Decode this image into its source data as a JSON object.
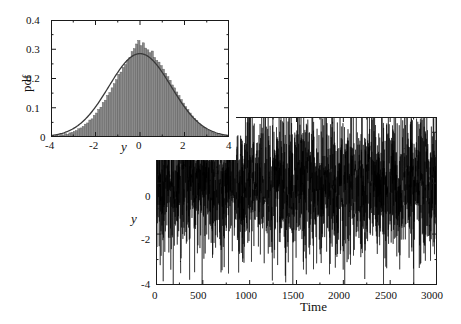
{
  "figure": {
    "background_color": "#ffffff",
    "axis_color": "#1a1a1a",
    "trace_color": "#000000",
    "hist_fill_color": "#8a8a8a",
    "hist_edge_color": "#555555",
    "curve_color": "#3a3a3a"
  },
  "chart_data": [
    {
      "type": "line",
      "name": "time-series",
      "title": "",
      "xlabel": "Time",
      "ylabel": "y",
      "xlim": [
        0,
        3000
      ],
      "ylim": [
        -4,
        2.6
      ],
      "grid": false,
      "legend": "none",
      "xticks": [
        0,
        500,
        1000,
        1500,
        2000,
        2500,
        3000
      ],
      "xtick_labels": [
        "0",
        "500",
        "1000",
        "1500",
        "2000",
        "2500",
        "3000"
      ],
      "yticks": [
        2,
        0,
        -2,
        -4
      ],
      "ytick_labels": [
        "2",
        "0",
        "-2",
        "-4"
      ],
      "description": "Dense stochastic Gaussian noise trace y(t) sampled at unit time steps, zero mean, standard deviation about 1.4, spanning t = 0 to 3000.",
      "series": [
        {
          "name": "y(t)",
          "n_points": 3000,
          "mean": 0.0,
          "std": 1.4,
          "min": -4.0,
          "max": 2.6
        }
      ]
    },
    {
      "type": "bar",
      "name": "pdf-inset",
      "title": "",
      "xlabel": "y",
      "ylabel": "pdf",
      "xlim": [
        -4,
        4
      ],
      "ylim": [
        0,
        0.4
      ],
      "grid": false,
      "legend": "none",
      "xticks": [
        -4,
        -2,
        0,
        2,
        4
      ],
      "xtick_labels": [
        "-4",
        "-2",
        "0",
        "2",
        "4"
      ],
      "yticks": [
        0,
        0.1,
        0.2,
        0.3,
        0.4
      ],
      "ytick_labels": [
        "0",
        "0.1",
        "0.2",
        "0.3",
        "0.4"
      ],
      "description": "Normalized histogram of y values (gray bars) overlaid with a fitted Gaussian probability density curve peaking near 0.285 at y = 0.",
      "overlay_curve": {
        "name": "gaussian-fit",
        "mean": 0.0,
        "std": 1.4,
        "peak": 0.285
      },
      "categories": [
        -3.95,
        -3.85,
        -3.75,
        -3.65,
        -3.55,
        -3.45,
        -3.35,
        -3.25,
        -3.15,
        -3.05,
        -2.95,
        -2.85,
        -2.75,
        -2.65,
        -2.55,
        -2.45,
        -2.35,
        -2.25,
        -2.15,
        -2.05,
        -1.95,
        -1.85,
        -1.75,
        -1.65,
        -1.55,
        -1.45,
        -1.35,
        -1.25,
        -1.15,
        -1.05,
        -0.95,
        -0.85,
        -0.75,
        -0.65,
        -0.55,
        -0.45,
        -0.35,
        -0.25,
        -0.15,
        -0.05,
        0.05,
        0.15,
        0.25,
        0.35,
        0.45,
        0.55,
        0.65,
        0.75,
        0.85,
        0.95,
        1.05,
        1.15,
        1.25,
        1.35,
        1.45,
        1.55,
        1.65,
        1.75,
        1.85,
        1.95,
        2.05,
        2.15,
        2.25,
        2.35,
        2.45,
        2.55,
        2.65,
        2.75,
        2.85,
        2.95,
        3.05,
        3.15,
        3.25,
        3.35,
        3.45,
        3.55,
        3.65,
        3.75,
        3.85,
        3.95
      ],
      "values": [
        0.004,
        0.003,
        0.006,
        0.004,
        0.008,
        0.007,
        0.011,
        0.009,
        0.014,
        0.016,
        0.019,
        0.022,
        0.028,
        0.031,
        0.036,
        0.044,
        0.048,
        0.058,
        0.062,
        0.074,
        0.082,
        0.094,
        0.102,
        0.118,
        0.126,
        0.142,
        0.152,
        0.168,
        0.182,
        0.196,
        0.214,
        0.222,
        0.238,
        0.248,
        0.262,
        0.272,
        0.292,
        0.302,
        0.318,
        0.33,
        0.312,
        0.322,
        0.304,
        0.298,
        0.288,
        0.294,
        0.272,
        0.262,
        0.256,
        0.244,
        0.232,
        0.218,
        0.206,
        0.194,
        0.178,
        0.168,
        0.154,
        0.142,
        0.128,
        0.116,
        0.104,
        0.094,
        0.082,
        0.072,
        0.064,
        0.056,
        0.046,
        0.04,
        0.034,
        0.028,
        0.024,
        0.019,
        0.016,
        0.013,
        0.01,
        0.008,
        0.007,
        0.005,
        0.004,
        0.003
      ]
    }
  ],
  "main_plot": {
    "xlabel": "Time",
    "ylabel": "y",
    "xticks": [
      "0",
      "500",
      "1000",
      "1500",
      "2000",
      "2500",
      "3000"
    ],
    "yticks": [
      "2",
      "0",
      "-2",
      "-4"
    ]
  },
  "inset_plot": {
    "xlabel": "y",
    "ylabel": "pdf",
    "xticks": [
      "-4",
      "-2",
      "0",
      "2",
      "4"
    ],
    "yticks": [
      "0.4",
      "0.3",
      "0.2",
      "0.1",
      "0"
    ]
  }
}
